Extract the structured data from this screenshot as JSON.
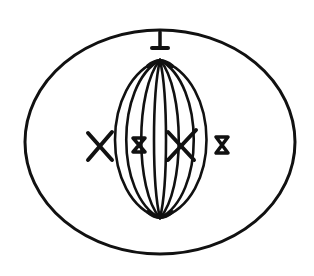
{
  "diagram": {
    "ink_color": "#111111",
    "background": "#ffffff",
    "parts": [
      "cell-membrane",
      "centrosome",
      "spindle-fibers",
      "chromosomes"
    ],
    "chromosome_count": 4,
    "spindle_fiber_count": 8
  }
}
